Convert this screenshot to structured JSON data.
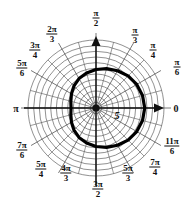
{
  "figure": {
    "background_color": "#ffffff",
    "ink_color": "#111111",
    "grid_color": "#555555",
    "center": {
      "x": 96,
      "y": 108
    },
    "grid": {
      "circle_count": 12,
      "outer_radius": 68,
      "spoke_count": 24,
      "spoke_step_degrees": 15
    },
    "axes": {
      "horizontal_arrow": true,
      "vertical_arrow": true,
      "horizontal_extent": [
        24,
        158
      ],
      "vertical_extent": [
        40,
        186
      ]
    }
  },
  "angle_labels": [
    {
      "id": "zero",
      "num": "0",
      "den": "",
      "kind": "plain",
      "x": 176,
      "y": 108,
      "angle_deg": 0
    },
    {
      "id": "pi-over-6",
      "num": "π",
      "den": "6",
      "kind": "frac",
      "x": 177,
      "y": 67,
      "angle_deg": 30
    },
    {
      "id": "pi-over-4",
      "num": "π",
      "den": "4",
      "kind": "frac",
      "x": 153,
      "y": 50,
      "angle_deg": 45
    },
    {
      "id": "pi-over-3",
      "num": "π",
      "den": "3",
      "kind": "frac",
      "x": 135,
      "y": 35,
      "angle_deg": 60
    },
    {
      "id": "pi-over-2",
      "num": "π",
      "den": "2",
      "kind": "frac",
      "x": 96,
      "y": 18,
      "angle_deg": 90
    },
    {
      "id": "two-pi-over-3",
      "num": "2π",
      "den": "3",
      "kind": "frac",
      "x": 52,
      "y": 34,
      "angle_deg": 120
    },
    {
      "id": "three-pi-over-4",
      "num": "3π",
      "den": "4",
      "kind": "frac",
      "x": 35,
      "y": 50,
      "angle_deg": 135
    },
    {
      "id": "five-pi-over-6",
      "num": "5π",
      "den": "6",
      "kind": "frac",
      "x": 22,
      "y": 68,
      "angle_deg": 150
    },
    {
      "id": "pi",
      "num": "π",
      "den": "",
      "kind": "plain",
      "x": 16,
      "y": 108,
      "angle_deg": 180
    },
    {
      "id": "seven-pi-over-6",
      "num": "7π",
      "den": "6",
      "kind": "frac",
      "x": 22,
      "y": 150,
      "angle_deg": 210
    },
    {
      "id": "five-pi-over-4",
      "num": "5π",
      "den": "4",
      "kind": "frac",
      "x": 41,
      "y": 169,
      "angle_deg": 225
    },
    {
      "id": "four-pi-over-3",
      "num": "4π",
      "den": "3",
      "kind": "frac",
      "x": 66,
      "y": 173,
      "angle_deg": 240
    },
    {
      "id": "three-pi-over-2",
      "num": "3π",
      "den": "2",
      "kind": "frac",
      "x": 98,
      "y": 189,
      "angle_deg": 270
    },
    {
      "id": "five-pi-over-3",
      "num": "5π",
      "den": "3",
      "kind": "frac",
      "x": 128,
      "y": 173,
      "angle_deg": 300
    },
    {
      "id": "seven-pi-over-4",
      "num": "7π",
      "den": "4",
      "kind": "frac",
      "x": 155,
      "y": 167,
      "angle_deg": 315
    },
    {
      "id": "eleven-pi-over-6",
      "num": "11π",
      "den": "6",
      "kind": "frac",
      "x": 172,
      "y": 146,
      "angle_deg": 330
    }
  ],
  "curve": {
    "label": "5",
    "label_position": {
      "x": 117,
      "y": 115
    },
    "stroke_width": 3.2,
    "stroke_color": "#000000",
    "description": "closed polar curve, limacon-like, bulging toward 0 radians"
  },
  "chart_data": {
    "type": "line",
    "title": "",
    "xlabel": "",
    "ylabel": "",
    "coordinate_system": "polar",
    "angle_tick_labels": [
      "0",
      "π/6",
      "π/4",
      "π/3",
      "π/2",
      "2π/3",
      "3π/4",
      "5π/6",
      "π",
      "7π/6",
      "5π/4",
      "4π/3",
      "3π/2",
      "5π/3",
      "7π/4",
      "11π/6"
    ],
    "angle_ticks_degrees": [
      0,
      30,
      45,
      60,
      90,
      120,
      135,
      150,
      180,
      210,
      225,
      240,
      270,
      300,
      315,
      330
    ],
    "radial_gridlines": 12,
    "rlim": [
      0,
      12
    ],
    "annotations": [
      "5"
    ],
    "grid": true,
    "legend": "none",
    "series": [
      {
        "name": "r(theta)",
        "theta_degrees": [
          0,
          15,
          30,
          45,
          60,
          75,
          90,
          105,
          120,
          135,
          150,
          165,
          180,
          195,
          210,
          225,
          240,
          255,
          270,
          285,
          300,
          315,
          330,
          345,
          360
        ],
        "r": [
          8.6,
          8.5,
          8.3,
          8.0,
          7.6,
          7.2,
          6.8,
          6.4,
          6.0,
          5.5,
          5.0,
          4.6,
          4.4,
          4.6,
          5.0,
          5.5,
          6.0,
          6.4,
          6.8,
          7.2,
          7.6,
          8.0,
          8.3,
          8.5,
          8.6
        ]
      }
    ]
  }
}
